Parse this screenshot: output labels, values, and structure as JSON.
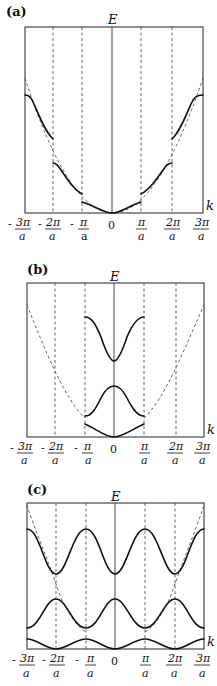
{
  "figure": {
    "panels": [
      {
        "id": "a",
        "label": "(a)",
        "y_axis_label": "E",
        "x_axis_label": "k",
        "description": "Nearly-free electron: free parabola (dashed) with gaps opened at zone boundaries; extended zone scheme"
      },
      {
        "id": "b",
        "label": "(b)",
        "y_axis_label": "E",
        "x_axis_label": "k",
        "description": "Reduced zone scheme: bands folded into first Brillouin zone -π/a..π/a"
      },
      {
        "id": "c",
        "label": "(c)",
        "y_axis_label": "E",
        "x_axis_label": "k",
        "description": "Periodic (repeated) zone scheme: bands repeated in every zone"
      }
    ],
    "x_ticks": [
      {
        "sign": "-",
        "num": "3π",
        "den": "a"
      },
      {
        "sign": "-",
        "num": "2π",
        "den": "a"
      },
      {
        "sign": "-",
        "num": "π",
        "den": "a"
      },
      {
        "sign": "",
        "num": "0",
        "den": ""
      },
      {
        "sign": "",
        "num": "π",
        "den": "a"
      },
      {
        "sign": "",
        "num": "2π",
        "den": "a"
      },
      {
        "sign": "",
        "num": "3π",
        "den": "a"
      }
    ]
  }
}
